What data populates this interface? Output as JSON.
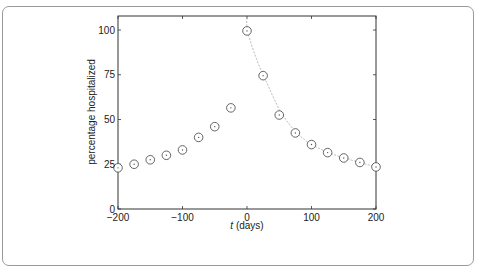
{
  "chart_data": {
    "type": "scatter",
    "title": "",
    "xlabel": "t (days)",
    "xlabel_italic_part": "t",
    "xlabel_rest": " (days)",
    "ylabel": "percentage hospitalized",
    "xlim": [
      -200,
      200
    ],
    "ylim": [
      0,
      107
    ],
    "xticks": [
      -200,
      -100,
      0,
      100,
      200
    ],
    "xtick_labels": [
      "−200",
      "−100",
      "0",
      "100",
      "200"
    ],
    "yticks": [
      0,
      25,
      50,
      75,
      100
    ],
    "ytick_labels": [
      "0",
      "25",
      "50",
      "75",
      "100"
    ],
    "grid": false,
    "legend": null,
    "series": [
      {
        "name": "pre-event (circles)",
        "marker": "circle-with-dot",
        "x": [
          -200,
          -175,
          -150,
          -125,
          -100,
          -75,
          -50,
          -25
        ],
        "y": [
          23,
          25,
          27.5,
          30,
          33,
          40,
          46,
          56.5
        ]
      },
      {
        "name": "post-event (circles)",
        "marker": "circle-with-dot",
        "x": [
          0,
          25,
          50,
          75,
          100,
          125,
          150,
          175,
          200
        ],
        "y": [
          99.5,
          74.5,
          52.5,
          42.5,
          36,
          31.5,
          28.5,
          26,
          23.5
        ]
      },
      {
        "name": "fitted decay curve",
        "style": "dotted-light-gray",
        "x": [
          -1,
          0,
          5,
          10,
          15,
          20,
          25,
          30,
          40,
          50,
          60,
          75,
          90,
          100,
          125,
          150,
          175,
          200
        ],
        "y": [
          107,
          100,
          94,
          88.5,
          83.5,
          79,
          75,
          71,
          63,
          55.5,
          50,
          43,
          38.5,
          36,
          31.5,
          28.5,
          26,
          23.5
        ]
      }
    ]
  },
  "colors": {
    "axis": "#333333",
    "marker": "#555555",
    "curve": "#bbbbbb",
    "frame": "#9a9a9a"
  }
}
